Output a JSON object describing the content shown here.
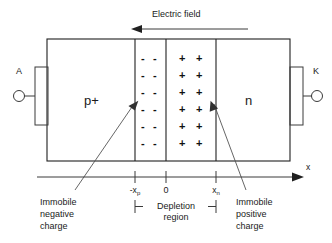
{
  "diagram": {
    "title_note": "PN junction depletion region diagram",
    "field_label": "Electric field",
    "terminals": {
      "anode": "A",
      "cathode": "K"
    },
    "regions": {
      "p_label": "p+",
      "n_label": "n"
    },
    "axis": {
      "name": "x",
      "ticks": [
        {
          "id": "minus-xp",
          "base": "-x",
          "subscript": "p"
        },
        {
          "id": "zero",
          "base": "0",
          "subscript": ""
        },
        {
          "id": "xn",
          "base": "x",
          "subscript": "n"
        }
      ]
    },
    "depletion": {
      "line1": "Depletion",
      "line2": "region"
    },
    "callouts": {
      "left": {
        "line1": "Immobile",
        "line2": "negative",
        "line3": "charge"
      },
      "right": {
        "line1": "Immobile",
        "line2": "positive",
        "line3": "charge"
      }
    },
    "charges": {
      "negative_glyph": "-",
      "positive_glyph": "+",
      "rows": 6,
      "columns": 2
    },
    "colors": {
      "line": "#3a3a3a",
      "text": "#1a1a1a",
      "background": "#ffffff"
    }
  }
}
